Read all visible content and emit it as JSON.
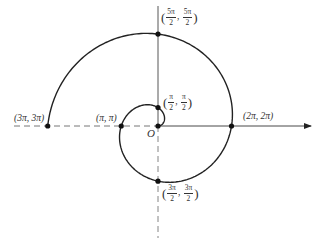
{
  "diagram": {
    "origin": {
      "label": "O",
      "cx": 158,
      "cy": 126
    },
    "spiral": {
      "equation": "r = θ",
      "theta_start": 0,
      "theta_end": "3π",
      "scale_px_per_rad": 11.7,
      "stroke": "#222222"
    },
    "axes": {
      "positive_x": {
        "style": "solid",
        "arrow": true
      },
      "negative_x": {
        "style": "dashed"
      },
      "positive_y": {
        "style": "solid"
      },
      "negative_y": {
        "style": "dashed"
      }
    },
    "points": [
      {
        "id": "p1",
        "label_text": "(π/2, π/2)",
        "num1": "π",
        "den1": "2",
        "num2": "π",
        "den2": "2",
        "type": "frac"
      },
      {
        "id": "p2",
        "label_text": "(π, π)",
        "type": "plain"
      },
      {
        "id": "p3",
        "label_text": "(3π/2, 3π/2)",
        "num1": "3π",
        "den1": "2",
        "num2": "3π",
        "den2": "2",
        "type": "frac"
      },
      {
        "id": "p4",
        "label_text": "(2π, 2π)",
        "type": "plain"
      },
      {
        "id": "p5",
        "label_text": "(5π/2, 5π/2)",
        "num1": "5π",
        "den1": "2",
        "num2": "5π",
        "den2": "2",
        "type": "frac"
      },
      {
        "id": "p6",
        "label_text": "(3π, 3π)",
        "type": "plain"
      }
    ],
    "labels": {
      "p2": "(π, π)",
      "p4": "(2π, 2π)",
      "p6": "(3π, 3π)",
      "open": "(",
      "close": ")",
      "comma": ", "
    }
  }
}
